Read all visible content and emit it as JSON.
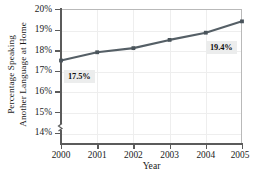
{
  "chart_data": {
    "type": "line",
    "title": "",
    "xlabel": "Year",
    "ylabel": "Percentage Speaking Another Language at Home",
    "ylabel_line1": "Percentage Speaking",
    "ylabel_line2": "Another Language at Home",
    "categories": [
      "2000",
      "2001",
      "2002",
      "2003",
      "2004",
      "2005"
    ],
    "x": [
      2000,
      2001,
      2002,
      2003,
      2004,
      2005
    ],
    "values": [
      17.5,
      17.9,
      18.1,
      18.5,
      18.85,
      19.4
    ],
    "series": [
      {
        "name": "Percentage Speaking Another Language at Home",
        "values": [
          17.5,
          17.9,
          18.1,
          18.5,
          18.85,
          19.4
        ]
      }
    ],
    "ylim": [
      13.5,
      20.0
    ],
    "xlim": [
      2000,
      2005
    ],
    "y_ticks": [
      14,
      15,
      16,
      17,
      18,
      19,
      20
    ],
    "y_tick_labels": [
      "14%",
      "15%",
      "16%",
      "17%",
      "18%",
      "19%",
      "20%"
    ],
    "x_tick_labels": [
      "2000",
      "2001",
      "2002",
      "2003",
      "2004",
      "2005"
    ],
    "grid": true,
    "legend": false,
    "axis_break": true,
    "annotations": [
      {
        "text": "17.5%",
        "point_x": 2000,
        "point_y": 17.5
      },
      {
        "text": "19.4%",
        "point_x": 2005,
        "point_y": 19.4
      }
    ],
    "colors": {
      "line": "#555f66",
      "marker": "#4a545b",
      "axis": "#5b5b5b",
      "grid": "#eeeeee",
      "text": "#1a1a1a",
      "callout_bg": "#eceded"
    }
  }
}
